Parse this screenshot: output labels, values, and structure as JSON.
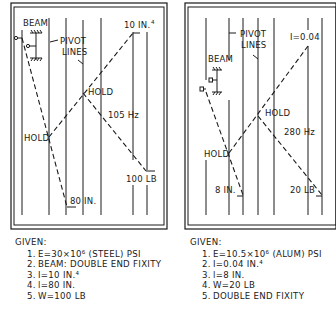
{
  "colors": {
    "ink": "#1a1a1a",
    "background": "#ffffff"
  },
  "left_nomograph": {
    "labels": {
      "beam": "BEAM",
      "pivot_lines": [
        "PIVOT",
        "LINES"
      ],
      "inertia": "10 IN.",
      "inertia_sup": "4",
      "hold_upper": "HOLD",
      "hold_lower": "HOLD",
      "frequency": "105 Hz",
      "weight": "100 LB",
      "length": "80 IN."
    },
    "given": {
      "title": "GIVEN:",
      "items": [
        {
          "num": "1.",
          "text": "E=30×10⁶ (STEEL) PSI"
        },
        {
          "num": "2.",
          "text": "BEAM: DOUBLE END FIXITY"
        },
        {
          "num": "3.",
          "text": "I=10 IN.⁴"
        },
        {
          "num": "4.",
          "text": "l=80 IN."
        },
        {
          "num": "5.",
          "text": "W=100 LB"
        }
      ]
    }
  },
  "right_nomograph": {
    "labels": {
      "beam": "BEAM",
      "pivot_lines": [
        "PIVOT",
        "LINES"
      ],
      "inertia": "I=0.04",
      "hold_upper": "HOLD",
      "hold_lower": "HOLD",
      "frequency": "280 Hz",
      "weight": "20 LB",
      "length": "8 IN."
    },
    "given": {
      "title": "GIVEN:",
      "items": [
        {
          "num": "1.",
          "text": "E=10.5×10⁶ (ALUM) PSI"
        },
        {
          "num": "2.",
          "text": "I=0.04 IN.⁴"
        },
        {
          "num": "3.",
          "text": "l=8 IN."
        },
        {
          "num": "4.",
          "text": "W=20 LB"
        },
        {
          "num": "5.",
          "text": "DOUBLE END FIXITY"
        }
      ]
    }
  }
}
